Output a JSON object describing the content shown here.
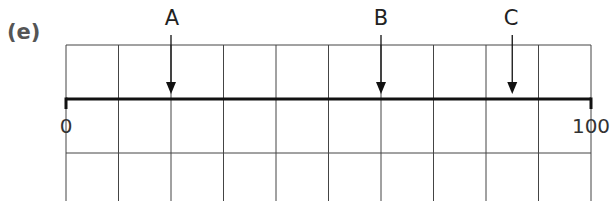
{
  "part_label": "(e)",
  "number_line": {
    "start": 0,
    "end": 100,
    "start_label": "0",
    "end_label": "100",
    "divisions": 10
  },
  "points": [
    {
      "label": "A",
      "value": 20
    },
    {
      "label": "B",
      "value": 60
    },
    {
      "label": "C",
      "value": 85
    }
  ],
  "grid": {
    "columns": 10,
    "rows": 3
  },
  "colors": {
    "grid": "#444444",
    "line": "#111111",
    "label": "#555555"
  }
}
